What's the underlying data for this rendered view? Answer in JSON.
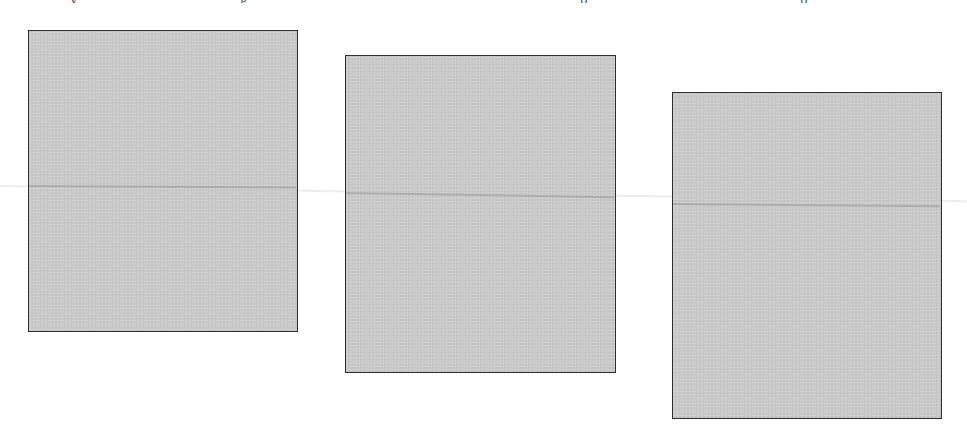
{
  "page": {
    "background": "#ffffff",
    "top_clipped_text_fragments": [
      {
        "x": 70,
        "text": "y"
      },
      {
        "x": 240,
        "text": "g"
      },
      {
        "x": 580,
        "text": "p"
      },
      {
        "x": 800,
        "text": "p"
      },
      {
        "x": 1010,
        "text": "p"
      }
    ]
  },
  "panels": [
    {
      "id": "panel-1",
      "x": 28,
      "y": 30,
      "width": 270,
      "height": 302,
      "fill": "#c9c9c9",
      "border": "#2e2e2e"
    },
    {
      "id": "panel-2",
      "x": 345,
      "y": 55,
      "width": 271,
      "height": 318,
      "fill": "#c9c9c9",
      "border": "#2e2e2e"
    },
    {
      "id": "panel-3",
      "x": 672,
      "y": 92,
      "width": 270,
      "height": 327,
      "fill": "#c9c9c9",
      "border": "#2e2e2e"
    }
  ],
  "fold_line": {
    "description": "faint horizontal crease across all panels",
    "y_start": 186,
    "y_end": 206
  }
}
